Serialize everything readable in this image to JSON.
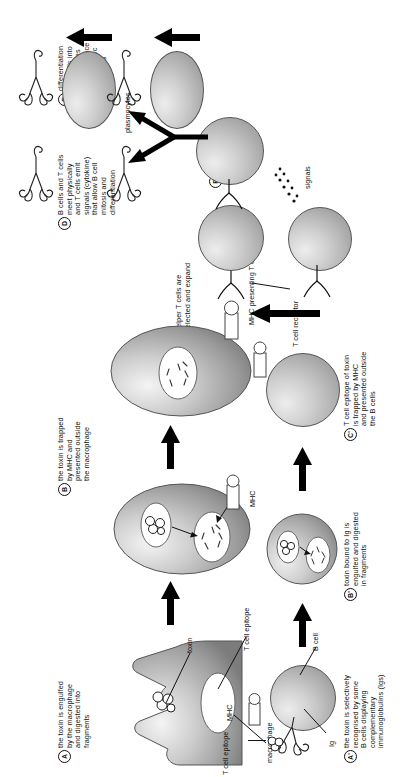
{
  "figure": {
    "orientation": "rotated-90-ccw"
  },
  "steps": [
    {
      "tag": "A",
      "text": "the toxin is engulfed\nby the macrophage\nand digested into\nfragments"
    },
    {
      "tag": "B",
      "text": "the toxin is trapped\nby MHC and\npresented outside\nthe macrophage"
    },
    {
      "tag": "C",
      "text": "helper T cells are\nselected and expand"
    },
    {
      "tag": "D",
      "text": "B cells and T cells\nmeet physically\nand T cells emit\nsignals (cytokine)\nthat allow B cell\nmitosis and\ndifferentiation"
    },
    {
      "tag": "E",
      "text": "differentiation\nof B cells into\nplasmocytes\nwhich produce\ntoxin-specific\nantibodies"
    },
    {
      "tag": "F",
      "text": "antibodies\nin blood\ncirculation\nare ready to\ntrap the toxin"
    },
    {
      "tag": "A'",
      "text": "the toxin is selectively\nrecognised by some\nB cells displaying\ncomplementary\nimmunoglobulins (Igs)"
    },
    {
      "tag": "B'",
      "text": "toxin bound to Ig is\nengulfed and digested\nin fragments"
    },
    {
      "tag": "C'",
      "text": "T cell epitope of toxin\nis trapped by MHC\nand presented outside\nthe B cells"
    }
  ],
  "labels": {
    "macrophage": "macrophage",
    "toxin": "toxin",
    "t_cell_epitope": "T cell epitope",
    "mhc": "MHC",
    "mhc_presenting": "MHC presenting T cell epitope",
    "t_cell_receptor": "T cell receptor",
    "t_cell_receptor_2": "T cell receptor",
    "signals": "signals",
    "plasmocytes": "plasmocytes",
    "ig": "Ig",
    "b_cell": "B cell",
    "t_cell_epitope_2": "T cell epitope",
    "mhc_2": "MHC"
  },
  "colors": {
    "ink": "#111111",
    "cell_fill_light": "#ededed",
    "cell_fill_mid": "#cfcfcf",
    "cell_fill_dark": "#8c8c8c",
    "outline": "#555555",
    "background": "#ffffff"
  }
}
